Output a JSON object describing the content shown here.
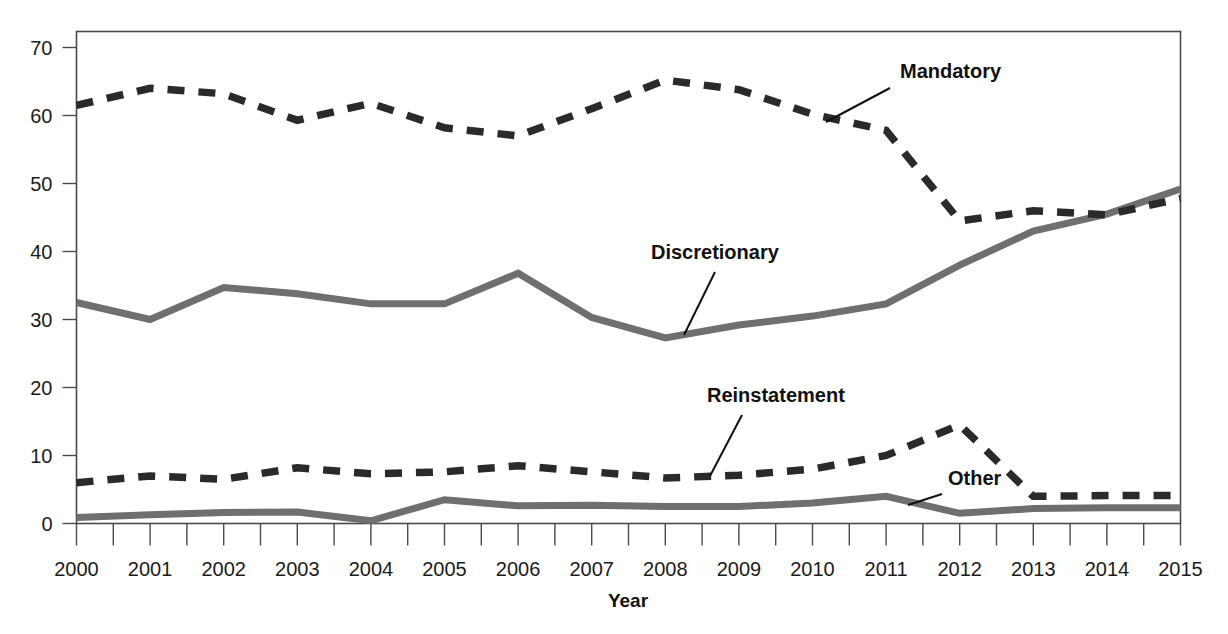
{
  "chart_data": {
    "type": "line",
    "title": "",
    "xlabel": "Year",
    "ylabel": "",
    "xlim": [
      2000,
      2015
    ],
    "ylim": [
      0,
      72
    ],
    "grid": false,
    "legend_position": "inline-annotations",
    "x": [
      2000,
      2001,
      2002,
      2003,
      2004,
      2005,
      2006,
      2007,
      2008,
      2009,
      2010,
      2011,
      2012,
      2013,
      2014,
      2015
    ],
    "x_tick_labels": [
      "2000",
      "2001",
      "2002",
      "2003",
      "2004",
      "2005",
      "2006",
      "2007",
      "2008",
      "2009",
      "2010",
      "2011",
      "2012",
      "2013",
      "2014",
      "2015"
    ],
    "y_tick_labels": [
      "0",
      "10",
      "20",
      "30",
      "40",
      "50",
      "60",
      "70"
    ],
    "y_ticks": [
      0,
      10,
      20,
      30,
      40,
      50,
      60,
      70
    ],
    "minor_x_ticks": true,
    "series": [
      {
        "name": "Mandatory",
        "style": "dashed",
        "color": "#2a2a2a",
        "values": [
          61.5,
          64.0,
          63.2,
          59.3,
          61.8,
          58.2,
          57.0,
          61.0,
          65.2,
          63.8,
          60.2,
          57.8,
          44.5,
          46.0,
          45.4,
          47.8
        ]
      },
      {
        "name": "Discretionary",
        "style": "solid",
        "color": "#6f6f6f",
        "values": [
          32.5,
          30.0,
          34.7,
          33.8,
          32.3,
          32.3,
          36.8,
          30.3,
          27.3,
          29.2,
          30.5,
          32.3,
          38.0,
          43.0,
          45.5,
          49.2
        ]
      },
      {
        "name": "Reinstatement",
        "style": "dashed",
        "color": "#2a2a2a",
        "values": [
          6.0,
          7.0,
          6.5,
          8.2,
          7.3,
          7.6,
          8.5,
          7.6,
          6.7,
          7.1,
          8.0,
          10.0,
          14.5,
          4.0,
          4.1,
          4.1
        ]
      },
      {
        "name": "Other",
        "style": "solid",
        "color": "#6f6f6f",
        "values": [
          0.9,
          1.3,
          1.6,
          1.7,
          0.4,
          3.5,
          2.6,
          2.7,
          2.5,
          2.5,
          3.0,
          4.0,
          1.5,
          2.2,
          2.3,
          2.3
        ]
      }
    ],
    "annotations": [
      {
        "label": "Mandatory",
        "text_x": 900,
        "text_y": 78,
        "leader_from_x": 890,
        "leader_from_y": 88,
        "leader_to_x": 826,
        "leader_to_y": 122
      },
      {
        "label": "Discretionary",
        "text_x": 651,
        "text_y": 259,
        "leader_from_x": 715,
        "leader_from_y": 272,
        "leader_to_x": 684,
        "leader_to_y": 335
      },
      {
        "label": "Reinstatement",
        "text_x": 707,
        "text_y": 402,
        "leader_from_x": 742,
        "leader_from_y": 415,
        "leader_to_x": 710,
        "leader_to_y": 476
      },
      {
        "label": "Other",
        "text_x": 948,
        "text_y": 485,
        "leader_from_x": 942,
        "leader_from_y": 494,
        "leader_to_x": 908,
        "leader_to_y": 505
      }
    ]
  },
  "axis": {
    "x_title": "Year"
  }
}
